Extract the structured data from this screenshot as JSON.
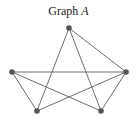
{
  "title": {
    "text": "Graph ",
    "label": "A"
  },
  "graph": {
    "vertices": [
      "top",
      "left",
      "right",
      "bottom-left",
      "bottom-right"
    ],
    "edges": [
      [
        "top",
        "bottom-left"
      ],
      [
        "top",
        "bottom-right"
      ],
      [
        "top",
        "right"
      ],
      [
        "left",
        "right"
      ],
      [
        "left",
        "bottom-left"
      ],
      [
        "left",
        "bottom-right"
      ],
      [
        "right",
        "bottom-left"
      ],
      [
        "right",
        "bottom-right"
      ]
    ],
    "edge_color": "#6e6e6e",
    "vertex_color": "#555555"
  }
}
